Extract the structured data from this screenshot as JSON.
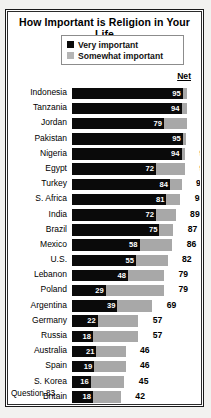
{
  "chart_data": {
    "type": "bar",
    "title": "How Important is Religion in Your Life",
    "subtype": "stacked-horizontal",
    "xlabel": "",
    "ylabel": "",
    "xlim": [
      0,
      100
    ],
    "grid": false,
    "legend_position": "top-center",
    "net_header": "Net",
    "footnote": "Question 83.",
    "legend": [
      {
        "label": "Very important",
        "color": "#0a0a0a",
        "swatch": "dark-square-swatch"
      },
      {
        "label": "Somewhat important",
        "color": "#a8a8a8",
        "swatch": "gray-square-swatch"
      }
    ],
    "series": [
      {
        "name": "Very important",
        "color": "#0a0a0a"
      },
      {
        "name": "Somewhat important",
        "color": "#a8a8a8"
      }
    ],
    "categories": [
      "Indonesia",
      "Tanzania",
      "Jordan",
      "Pakistan",
      "Nigeria",
      "Egypt",
      "Turkey",
      "S. Africa",
      "India",
      "Brazil",
      "Mexico",
      "U.S.",
      "Lebanon",
      "Poland",
      "Argentina",
      "Germany",
      "Russia",
      "Australia",
      "Spain",
      "S. Korea",
      "Britain",
      "Japan",
      "France"
    ],
    "rows": [
      {
        "country": "Indonesia",
        "very": 95,
        "net": 99
      },
      {
        "country": "Tanzania",
        "very": 94,
        "net": 99
      },
      {
        "country": "Jordan",
        "very": 79,
        "net": 99
      },
      {
        "country": "Pakistan",
        "very": 95,
        "net": 98
      },
      {
        "country": "Nigeria",
        "very": 94,
        "net": 97
      },
      {
        "country": "Egypt",
        "very": 72,
        "net": 97
      },
      {
        "country": "Turkey",
        "very": 84,
        "net": 94
      },
      {
        "country": "S. Africa",
        "very": 81,
        "net": 93
      },
      {
        "country": "India",
        "very": 72,
        "net": 89
      },
      {
        "country": "Brazil",
        "very": 75,
        "net": 87
      },
      {
        "country": "Mexico",
        "very": 58,
        "net": 86
      },
      {
        "country": "U.S.",
        "very": 55,
        "net": 82
      },
      {
        "country": "Lebanon",
        "very": 48,
        "net": 79
      },
      {
        "country": "Poland",
        "very": 29,
        "net": 79
      },
      {
        "country": "Argentina",
        "very": 39,
        "net": 69
      },
      {
        "country": "Germany",
        "very": 22,
        "net": 57
      },
      {
        "country": "Russia",
        "very": 18,
        "net": 57
      },
      {
        "country": "Australia",
        "very": 21,
        "net": 46
      },
      {
        "country": "Spain",
        "very": 19,
        "net": 46
      },
      {
        "country": "S. Korea",
        "very": 16,
        "net": 45
      },
      {
        "country": "Britain",
        "very": 18,
        "net": 42
      },
      {
        "country": "Japan",
        "very": 13,
        "net": 41
      },
      {
        "country": "France",
        "very": 10,
        "net": 37
      }
    ]
  }
}
